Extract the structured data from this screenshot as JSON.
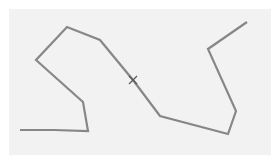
{
  "canvas": {
    "background_color": "#f2f2f2",
    "stroke_color": "#878787",
    "polyline": [
      [
        20,
        130
      ],
      [
        54,
        130
      ],
      [
        88,
        131
      ],
      [
        83,
        102
      ],
      [
        36,
        60
      ],
      [
        67,
        27
      ],
      [
        100,
        40
      ],
      [
        133,
        80
      ],
      [
        160,
        116
      ],
      [
        228,
        134
      ],
      [
        236,
        111
      ],
      [
        208,
        49
      ],
      [
        247,
        22
      ]
    ]
  },
  "cursor": {
    "icon": "crosshair-icon",
    "x": 133,
    "y": 80
  }
}
